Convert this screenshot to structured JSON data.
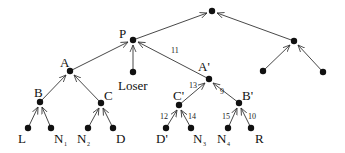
{
  "diagram": {
    "type": "tree",
    "direction": "leaves-to-root (arrows point upward toward parent)",
    "nodes": [
      {
        "id": "root",
        "label": "",
        "x": 212,
        "y": 11
      },
      {
        "id": "P",
        "label": "P",
        "x": 133,
        "y": 40
      },
      {
        "id": "R2",
        "label": "",
        "x": 294,
        "y": 41
      },
      {
        "id": "A",
        "label": "A",
        "x": 70,
        "y": 71
      },
      {
        "id": "Loser",
        "label": "Loser",
        "x": 133,
        "y": 72
      },
      {
        "id": "A'",
        "label": "A'",
        "x": 209,
        "y": 79
      },
      {
        "id": "R2L",
        "label": "",
        "x": 263,
        "y": 71
      },
      {
        "id": "R2R",
        "label": "",
        "x": 323,
        "y": 72
      },
      {
        "id": "B",
        "label": "B",
        "x": 40,
        "y": 102
      },
      {
        "id": "C",
        "label": "C",
        "x": 101,
        "y": 103
      },
      {
        "id": "C'",
        "label": "C'",
        "x": 179,
        "y": 105
      },
      {
        "id": "B'",
        "label": "B'",
        "x": 239,
        "y": 103
      },
      {
        "id": "L",
        "label": "L",
        "x": 28,
        "y": 128
      },
      {
        "id": "N1",
        "label": "N",
        "subscript": "1",
        "x": 51,
        "y": 128
      },
      {
        "id": "N2",
        "label": "N",
        "subscript": "2",
        "x": 88,
        "y": 128
      },
      {
        "id": "D",
        "label": "D",
        "x": 113,
        "y": 128
      },
      {
        "id": "D'",
        "label": "D'",
        "x": 166,
        "y": 128
      },
      {
        "id": "N3",
        "label": "N",
        "subscript": "3",
        "x": 191,
        "y": 128
      },
      {
        "id": "N4",
        "label": "N",
        "subscript": "4",
        "x": 228,
        "y": 128
      },
      {
        "id": "R",
        "label": "R",
        "x": 251,
        "y": 128
      }
    ],
    "edges": [
      {
        "from": "P",
        "to": "root",
        "weight": ""
      },
      {
        "from": "R2",
        "to": "root",
        "weight": ""
      },
      {
        "from": "A",
        "to": "P",
        "weight": ""
      },
      {
        "from": "Loser",
        "to": "P",
        "weight": ""
      },
      {
        "from": "A'",
        "to": "P",
        "weight": "11"
      },
      {
        "from": "R2L",
        "to": "R2",
        "weight": ""
      },
      {
        "from": "R2R",
        "to": "R2",
        "weight": ""
      },
      {
        "from": "B",
        "to": "A",
        "weight": ""
      },
      {
        "from": "C",
        "to": "A",
        "weight": ""
      },
      {
        "from": "C'",
        "to": "A'",
        "weight": "13"
      },
      {
        "from": "B'",
        "to": "A'",
        "weight": "9"
      },
      {
        "from": "L",
        "to": "B",
        "weight": ""
      },
      {
        "from": "N1",
        "to": "B",
        "weight": ""
      },
      {
        "from": "N2",
        "to": "C",
        "weight": ""
      },
      {
        "from": "D",
        "to": "C",
        "weight": ""
      },
      {
        "from": "D'",
        "to": "C'",
        "weight": "12"
      },
      {
        "from": "N3",
        "to": "C'",
        "weight": "14"
      },
      {
        "from": "N4",
        "to": "B'",
        "weight": "15"
      },
      {
        "from": "R",
        "to": "B'",
        "weight": "10"
      }
    ]
  },
  "labels": {
    "P": "P",
    "A": "A",
    "Aprime": "A'",
    "Loser": "Loser",
    "B": "B",
    "C": "C",
    "Cprime": "C'",
    "Bprime": "B'",
    "L": "L",
    "N": "N",
    "N1_sub": "1",
    "N2_sub": "2",
    "N3_sub": "3",
    "N4_sub": "4",
    "D": "D",
    "Dprime": "D'",
    "R": "R"
  },
  "weights": {
    "w11": "11",
    "w13": "13",
    "w9": "9",
    "w12": "12",
    "w14": "14",
    "w15": "15",
    "w10": "10"
  }
}
